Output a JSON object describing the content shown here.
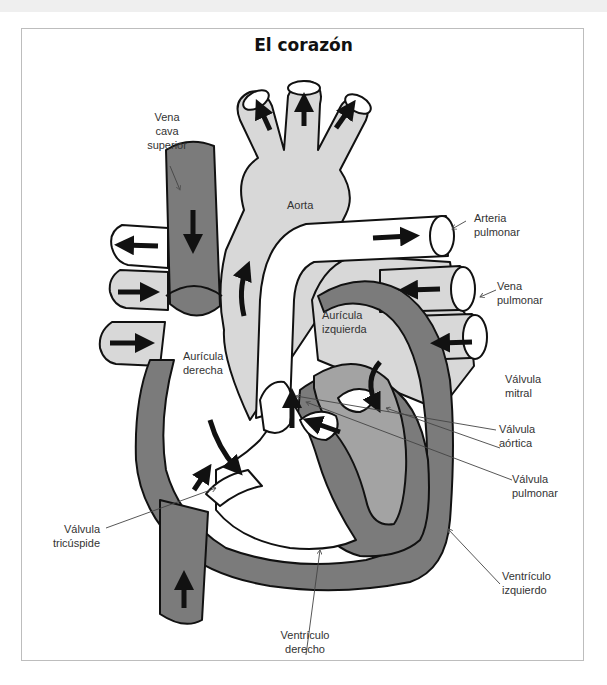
{
  "page": {
    "section_header": "Sistema cardiovascular"
  },
  "diagram": {
    "title": "El corazón",
    "colors": {
      "deoxygenated_vessel": "#7b7b7b",
      "left_heart": "#a3a3a3",
      "aorta": "#d8d8d8",
      "outline": "#111111",
      "frame": "#bdbdbd"
    },
    "labels": {
      "vena_cava_superior": [
        "Vena",
        "cava",
        "superior"
      ],
      "aorta": "Aorta",
      "arteria_pulmonar": [
        "Arteria",
        "pulmonar"
      ],
      "vena_pulmonar": [
        "Vena",
        "pulmonar"
      ],
      "auricula_izquierda": [
        "Aurícula",
        "izquierda"
      ],
      "auricula_derecha": [
        "Aurícula",
        "derecha"
      ],
      "valvula_mitral": [
        "Válvula",
        "mitral"
      ],
      "valvula_aortica": [
        "Válvula",
        "aórtica"
      ],
      "valvula_pulmonar": [
        "Válvula",
        "pulmonar"
      ],
      "valvula_tricuspide": [
        "Válvula",
        "tricúspide"
      ],
      "ventriculo_izquierdo": [
        "Ventrículo",
        "izquierdo"
      ],
      "ventriculo_derecho": [
        "Ventrículo",
        "derecho"
      ]
    }
  }
}
